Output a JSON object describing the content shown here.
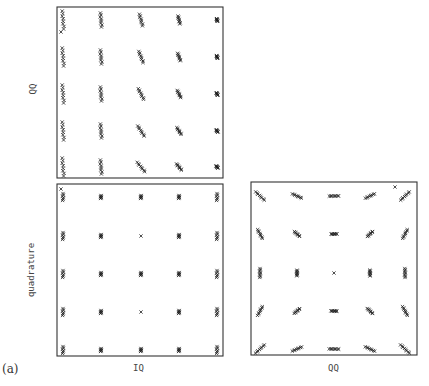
{
  "figure": {
    "tag": "(a)",
    "panels": [
      {
        "id": "top-left",
        "ylabel": "QQ",
        "xlabel": "",
        "box": [
          57,
          7,
          223,
          178
        ]
      },
      {
        "id": "bottom-left",
        "ylabel": "quadrature",
        "xlabel": "IQ",
        "box": [
          57,
          184,
          223,
          356
        ]
      },
      {
        "id": "bottom-right",
        "ylabel": "",
        "xlabel": "QQ",
        "box": [
          251,
          182,
          417,
          355
        ]
      }
    ]
  },
  "chart_data": [
    {
      "type": "scatter",
      "title": "",
      "xlabel": "",
      "ylabel": "QQ",
      "marker": "x",
      "grid": false,
      "description": "5x5 constellation; clusters elongated vertically/diagonally, spread decreasing from left column to right column",
      "cluster_columns": [
        1,
        2,
        3,
        4,
        5
      ],
      "cluster_rows": [
        1,
        2,
        3,
        4,
        5
      ],
      "cluster_spread_by_column": [
        "large vertical",
        "large vertical",
        "medium diagonal",
        "small diagonal",
        "tight"
      ],
      "outliers": [
        {
          "col": 1,
          "row": 1,
          "note": "single x below top-left cluster"
        }
      ]
    },
    {
      "type": "scatter",
      "title": "",
      "xlabel": "IQ",
      "ylabel": "quadrature",
      "marker": "x",
      "grid": false,
      "description": "5x5 constellation; tight clusters, slightly vertically elongated at left/right edge columns",
      "cluster_columns": [
        1,
        2,
        3,
        4,
        5
      ],
      "cluster_rows": [
        1,
        2,
        3,
        4,
        5
      ],
      "outliers": [
        {
          "col": 1,
          "row": 1,
          "note": "single x at top-left corner"
        }
      ]
    },
    {
      "type": "scatter",
      "title": "",
      "xlabel": "QQ",
      "ylabel": "",
      "marker": "x",
      "grid": false,
      "description": "5x5 constellation; outer clusters elongated tangentially (rotational spread), center point single x",
      "cluster_columns": [
        1,
        2,
        3,
        4,
        5
      ],
      "cluster_rows": [
        1,
        2,
        3,
        4,
        5
      ],
      "outliers": [
        {
          "col": 5,
          "row": 1,
          "note": "single x near top-right corner"
        }
      ]
    }
  ]
}
